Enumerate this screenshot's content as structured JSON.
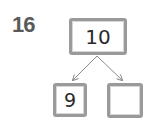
{
  "problem": {
    "number": "16"
  },
  "number_bond": {
    "whole": "10",
    "parts": [
      "9",
      ""
    ]
  },
  "colors": {
    "box_border": "#9a9a9a",
    "number_text": "#5a5a5a",
    "arrow": "#8a8a8a"
  }
}
